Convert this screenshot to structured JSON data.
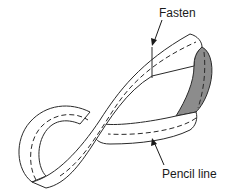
{
  "figure": {
    "labels": {
      "fasten": "Fasten",
      "pencil_line": "Pencil line"
    },
    "colors": {
      "outline": "#2a2a2a",
      "shaded_face": "#8c8c8c",
      "strip_face": "#ffffff"
    }
  }
}
